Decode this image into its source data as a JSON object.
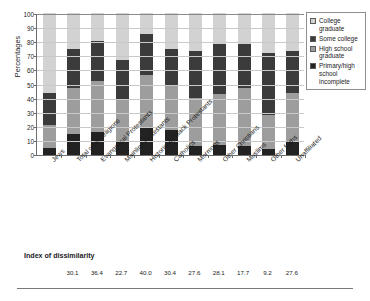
{
  "chart_data": {
    "type": "bar",
    "subtype": "stacked-bar-100",
    "title": "",
    "xlabel": "",
    "ylabel": "Percentages",
    "ylim": [
      0,
      100
    ],
    "yticks": [
      0,
      10,
      20,
      30,
      40,
      50,
      60,
      70,
      80,
      90,
      100
    ],
    "grid": true,
    "legend_position": "right",
    "categories": [
      "Jews",
      "Total other religions",
      "Evangelical Protestants",
      "Mainline Protestants",
      "Historically black Protestants",
      "Catholics",
      "Mormons",
      "Other Christians",
      "Muslims",
      "Other faiths",
      "Unaffiliated"
    ],
    "series": [
      {
        "name": "Primary/high school incomplete",
        "color": "#222222",
        "values": [
          5,
          15,
          16,
          10,
          20,
          17.5,
          6,
          7,
          6,
          4,
          9
        ]
      },
      {
        "name": "High school graduate",
        "color": "#9d9d9d",
        "values": [
          16,
          32,
          36,
          29,
          36.5,
          32,
          34,
          36,
          41,
          24,
          35
        ]
      },
      {
        "name": "Some college",
        "color": "#3b3b3b",
        "values": [
          23,
          27.5,
          28.5,
          28,
          28.5,
          25,
          33,
          35,
          31,
          44,
          29
        ]
      },
      {
        "name": "College graduate",
        "color": "#d2d2d2",
        "values": [
          56,
          25.5,
          19.5,
          33,
          15,
          25.5,
          27,
          22,
          22,
          28,
          27
        ]
      }
    ]
  },
  "legend": {
    "items": [
      {
        "label": "College graduate",
        "swatch": "#d2d2d2"
      },
      {
        "label": "Some college",
        "swatch": "#3b3b3b"
      },
      {
        "label": "High school graduate",
        "swatch": "#9d9d9d"
      },
      {
        "label": "Primary/high school incomplete",
        "swatch": "#222222"
      }
    ]
  },
  "index_of_dissimilarity": {
    "title": "Index of dissimilarity",
    "values": [
      "30.1",
      "36.4",
      "22.7",
      "40.0",
      "30.4",
      "27.6",
      "28.1",
      "17.7",
      "9.2",
      "27.6"
    ]
  }
}
